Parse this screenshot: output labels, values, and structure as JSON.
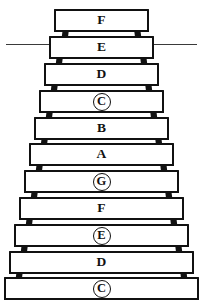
{
  "diagram": {
    "type": "instrument-diagram",
    "instrument": "xylophone",
    "bar_count": 11,
    "colors": {
      "bar_fill": "#ffffff",
      "bar_outline": "#111111",
      "connector": "#121212",
      "background": "#ffffff",
      "text": "#111111"
    },
    "bars": [
      {
        "note": "F",
        "circled": false,
        "index": 1
      },
      {
        "note": "E",
        "circled": false,
        "index": 2
      },
      {
        "note": "D",
        "circled": false,
        "index": 3
      },
      {
        "note": "C",
        "circled": true,
        "index": 4
      },
      {
        "note": "B",
        "circled": false,
        "index": 5
      },
      {
        "note": "A",
        "circled": false,
        "index": 6
      },
      {
        "note": "G",
        "circled": true,
        "index": 7
      },
      {
        "note": "F",
        "circled": false,
        "index": 8
      },
      {
        "note": "E",
        "circled": true,
        "index": 9
      },
      {
        "note": "D",
        "circled": false,
        "index": 10
      },
      {
        "note": "C",
        "circled": true,
        "index": 11
      }
    ]
  }
}
